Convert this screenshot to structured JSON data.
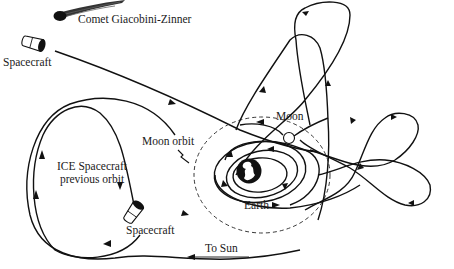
{
  "diagram": {
    "labels": {
      "comet": "Comet Giacobini-Zinner",
      "spacecraft_top": "Spacecraft",
      "moon": "Moon",
      "moon_orbit": "Moon orbit",
      "ice_previous_orbit_line1": "ICE Spacecraft",
      "ice_previous_orbit_line2": "previous orbit",
      "earth": "Earth",
      "spacecraft_bottom": "Spacecraft",
      "to_sun": "To Sun"
    },
    "elements": [
      {
        "name": "comet",
        "shape": "comet-icon"
      },
      {
        "name": "spacecraft (departing)",
        "shape": "spacecraft-icon"
      },
      {
        "name": "spacecraft (arriving)",
        "shape": "spacecraft-icon"
      },
      {
        "name": "Earth",
        "shape": "filled circle with continents"
      },
      {
        "name": "Moon",
        "shape": "small open circle"
      },
      {
        "name": "Moon orbit",
        "shape": "dashed circle"
      },
      {
        "name": "ICE previous orbit",
        "shape": "large elliptical loop"
      },
      {
        "name": "figure-eight loops",
        "shape": "lunar swing-by loops"
      },
      {
        "name": "To Sun arrow",
        "shape": "left-pointing arrow"
      }
    ]
  }
}
